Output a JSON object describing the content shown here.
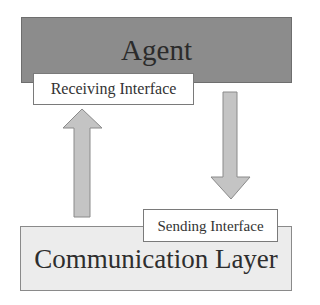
{
  "diagram": {
    "agent": {
      "label": "Agent",
      "fill": "#8c8c8c"
    },
    "receiving_interface": {
      "label": "Receiving Interface"
    },
    "sending_interface": {
      "label": "Sending Interface"
    },
    "communication_layer": {
      "label": "Communication Layer",
      "fill": "#ececec"
    },
    "arrows": [
      {
        "name": "up-arrow",
        "from": "Communication Layer",
        "to": "Receiving Interface",
        "direction": "up"
      },
      {
        "name": "down-arrow",
        "from": "Agent",
        "to": "Sending Interface",
        "direction": "down"
      }
    ],
    "arrow_fill": "#c4c4c4"
  }
}
